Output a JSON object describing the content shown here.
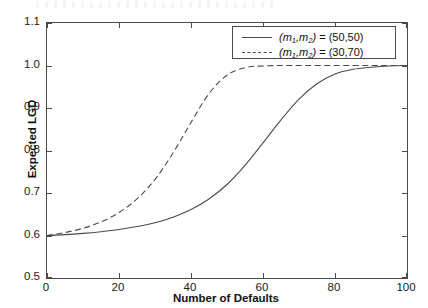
{
  "chart_data": {
    "type": "line",
    "title": "",
    "xlabel": "Number of Defaults",
    "ylabel": "Expected LGD",
    "xlim": [
      0,
      100
    ],
    "ylim": [
      0.5,
      1.1
    ],
    "xticks": [
      "0",
      "20",
      "40",
      "60",
      "80",
      "100"
    ],
    "yticks": [
      "0.5",
      "0.6",
      "0.7",
      "0.8",
      "0.9",
      "1.0",
      "1.1"
    ],
    "grid": false,
    "legend_position": "upper right",
    "series": [
      {
        "name": "(m1,m2) = (50,50)",
        "style": "solid",
        "color": "#4a4a4a",
        "x": [
          0,
          5,
          10,
          15,
          20,
          25,
          30,
          35,
          40,
          45,
          50,
          55,
          60,
          65,
          70,
          75,
          80,
          85,
          90,
          95,
          100
        ],
        "y": [
          0.6,
          0.602,
          0.605,
          0.609,
          0.614,
          0.621,
          0.63,
          0.643,
          0.661,
          0.686,
          0.72,
          0.765,
          0.818,
          0.872,
          0.921,
          0.957,
          0.98,
          0.991,
          0.996,
          0.999,
          1.0
        ]
      },
      {
        "name": "(m1,m2) = (30,70)",
        "style": "dashed",
        "color": "#4a4a4a",
        "x": [
          0,
          5,
          10,
          15,
          20,
          25,
          30,
          35,
          40,
          45,
          50,
          55,
          60,
          65,
          70,
          75,
          80,
          85,
          90,
          95,
          100
        ],
        "y": [
          0.6,
          0.607,
          0.617,
          0.632,
          0.654,
          0.686,
          0.732,
          0.794,
          0.866,
          0.934,
          0.977,
          0.995,
          0.999,
          1.0,
          1.0,
          1.0,
          1.0,
          1.0,
          1.0,
          1.0,
          1.0
        ]
      }
    ]
  },
  "legend": {
    "entries": [
      {
        "prefix": "(",
        "m1": "m",
        "sub1": "1",
        "sep": ",",
        "m2": "m",
        "sub2": "2",
        "suffix": ") = (50,50)",
        "style": "solid"
      },
      {
        "prefix": "(",
        "m1": "m",
        "sub1": "1",
        "sep": ",",
        "m2": "m",
        "sub2": "2",
        "suffix": ") = (30,70)",
        "style": "dashed"
      }
    ],
    "label_0": "(m1,m2) = (50,50)",
    "label_1": "(m1,m2) = (30,70)"
  },
  "colors": {
    "axis": "#4a4a4a",
    "text": "#111111",
    "background": "#ffffff"
  }
}
